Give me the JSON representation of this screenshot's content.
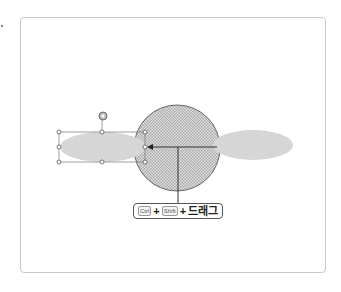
{
  "callout": {
    "key1": "Ctrl",
    "plus1": "+",
    "key2": "Shift",
    "plus2": "+",
    "action": "드래그"
  },
  "shapes": {
    "circle": {
      "fill_pattern": "checker",
      "stroke": "#666666",
      "fill": "#d0d0d0"
    },
    "ellipse_left": {
      "fill": "#d6d6d6",
      "selected": true
    },
    "ellipse_right": {
      "fill": "#d6d6d6"
    },
    "arrow_color": "#333333"
  }
}
